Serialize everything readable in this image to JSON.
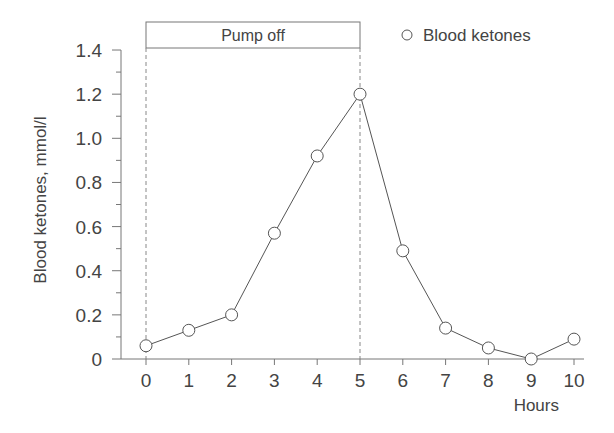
{
  "chart_data": {
    "type": "line",
    "title": "",
    "xlabel": "Hours",
    "ylabel": "Blood ketones, mmol/l",
    "x": [
      0,
      1,
      2,
      3,
      4,
      5,
      6,
      7,
      8,
      9,
      10
    ],
    "series": [
      {
        "name": "Blood ketones",
        "marker": "open-circle",
        "values": [
          0.06,
          0.13,
          0.2,
          0.57,
          0.92,
          1.2,
          0.49,
          0.14,
          0.05,
          0.0,
          0.09
        ]
      }
    ],
    "xlim": [
      0,
      10
    ],
    "ylim": [
      0,
      1.4
    ],
    "x_ticks": [
      "0",
      "1",
      "2",
      "3",
      "4",
      "5",
      "6",
      "7",
      "8",
      "9",
      "10"
    ],
    "y_ticks": [
      "0",
      "0.2",
      "0.4",
      "0.6",
      "0.8",
      "1.0",
      "1.2",
      "1.4"
    ],
    "grid": false,
    "legend_position": "top-right",
    "annotations": [
      {
        "type": "shaded-interval-box",
        "label": "Pump off",
        "x_start": 0,
        "x_end": 5,
        "style": "dashed vertical lines"
      }
    ]
  },
  "colors": {
    "line": "#555555",
    "axis": "#777777",
    "text": "#444444",
    "marker_fill": "#ffffff"
  }
}
